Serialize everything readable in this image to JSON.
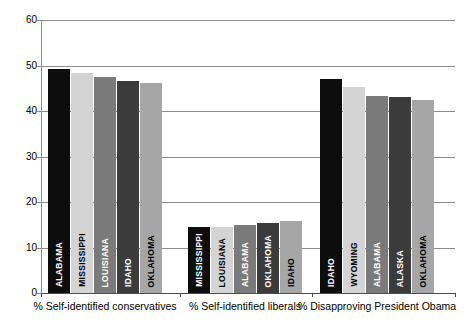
{
  "chart_data": {
    "type": "bar",
    "title": "",
    "xlabel": "",
    "ylabel": "",
    "ylim": [
      0,
      60
    ],
    "yticks": [
      0,
      10,
      20,
      30,
      40,
      50,
      60
    ],
    "grid": true,
    "legend": "none",
    "categories": [
      "% Self-identified conservatives",
      "% Self-identified liberals",
      "% Disapproving President Obama"
    ],
    "groups": [
      {
        "category": "% Self-identified conservatives",
        "bars": [
          {
            "label": "ALABAMA",
            "value": 49.2,
            "color": "#0d0d0d"
          },
          {
            "label": "MISSISSIPPI",
            "value": 48.3,
            "color": "#d4d4d4"
          },
          {
            "label": "LOUISIANA",
            "value": 47.4,
            "color": "#7a7a7a"
          },
          {
            "label": "IDAHO",
            "value": 46.5,
            "color": "#3b3b3b"
          },
          {
            "label": "OKLAHOMA",
            "value": 46.2,
            "color": "#a6a6a6"
          }
        ]
      },
      {
        "category": "% Self-identified liberals",
        "bars": [
          {
            "label": "MISSISSIPPI",
            "value": 14.6,
            "color": "#0d0d0d"
          },
          {
            "label": "LOUISIANA",
            "value": 14.5,
            "color": "#d4d4d4"
          },
          {
            "label": "ALABAMA",
            "value": 15.0,
            "color": "#7a7a7a"
          },
          {
            "label": "OKLAHOMA",
            "value": 15.4,
            "color": "#3b3b3b"
          },
          {
            "label": "IDAHO",
            "value": 15.9,
            "color": "#a6a6a6"
          }
        ]
      },
      {
        "category": "% Disapproving President Obama",
        "bars": [
          {
            "label": "IDAHO",
            "value": 47.0,
            "color": "#0d0d0d"
          },
          {
            "label": "WYOMING",
            "value": 45.3,
            "color": "#d4d4d4"
          },
          {
            "label": "ALABAMA",
            "value": 43.3,
            "color": "#7a7a7a"
          },
          {
            "label": "ALASKA",
            "value": 43.1,
            "color": "#3b3b3b"
          },
          {
            "label": "OKLAHOMA",
            "value": 42.5,
            "color": "#a6a6a6"
          }
        ]
      }
    ],
    "axis": {
      "gridline_color": "#8c8c8c",
      "axis_color": "#4d4d4d",
      "background": "#ffffff"
    }
  }
}
